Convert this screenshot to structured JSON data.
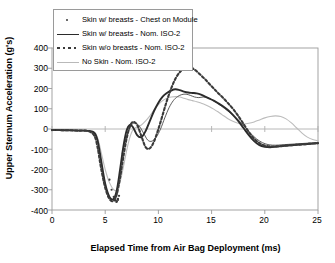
{
  "chart_data": {
    "type": "line",
    "title": "",
    "xlabel": "Elapsed Time from Air Bag Deployment (ms)",
    "ylabel": "Upper Sternum Acceleration (g's)",
    "xlim": [
      0,
      25
    ],
    "ylim": [
      -400,
      400
    ],
    "xticks": [
      0,
      5,
      10,
      15,
      20,
      25
    ],
    "yticks": [
      400,
      300,
      200,
      100,
      0,
      -100,
      -200,
      -300,
      -400
    ],
    "grid": false,
    "legend_position": "top-left",
    "series": [
      {
        "name": "Skin w/ breasts - Chest on Module",
        "style": "dot-marker",
        "color": "#3a3a3a",
        "x": [
          5.4,
          5.6,
          5.8,
          6.0,
          6.1,
          6.2,
          6.3,
          6.1,
          5.9,
          6.05,
          6.2
        ],
        "y": [
          -250,
          -300,
          -335,
          -352,
          -358,
          -345,
          -330,
          -315,
          -340,
          -360,
          -350
        ]
      },
      {
        "name": "Skin w/ breasts - Nom. ISO-2",
        "style": "solid",
        "color": "#2b2b2b",
        "x": [
          0,
          0.5,
          1,
          1.5,
          2,
          2.5,
          3,
          3.5,
          4,
          4.3,
          4.6,
          5,
          5.4,
          5.8,
          6.1,
          6.4,
          6.7,
          7,
          7.3,
          7.6,
          8,
          8.4,
          8.8,
          9.2,
          9.6,
          10,
          10.4,
          10.8,
          11.2,
          11.6,
          12,
          12.4,
          12.8,
          13.2,
          13.6,
          14,
          14.4,
          14.8,
          15.2,
          15.6,
          16,
          16.5,
          17,
          17.5,
          18,
          18.5,
          19,
          19.5,
          20,
          20.5,
          21,
          21.5,
          22,
          22.5,
          23,
          23.5,
          24,
          24.5,
          25
        ],
        "y": [
          -5,
          -5,
          -6,
          -6,
          -7,
          -8,
          -8,
          -10,
          -20,
          -60,
          -150,
          -270,
          -335,
          -345,
          -300,
          -200,
          -90,
          -10,
          20,
          10,
          -30,
          -40,
          -10,
          40,
          90,
          130,
          160,
          178,
          190,
          196,
          192,
          185,
          180,
          178,
          176,
          170,
          160,
          150,
          140,
          128,
          115,
          95,
          70,
          40,
          5,
          -30,
          -60,
          -80,
          -88,
          -90,
          -88,
          -85,
          -82,
          -80,
          -78,
          -76,
          -74,
          -72,
          -70
        ]
      },
      {
        "name": "Skin w/o breasts - Nom. ISO-2",
        "style": "dashed",
        "color": "#3a3a3a",
        "x": [
          0,
          0.5,
          1,
          1.5,
          2,
          2.5,
          3,
          3.5,
          4,
          4.3,
          4.6,
          5,
          5.4,
          5.8,
          6.1,
          6.4,
          6.7,
          7,
          7.3,
          7.6,
          8,
          8.4,
          8.8,
          9.2,
          9.6,
          10,
          10.4,
          10.8,
          11.2,
          11.6,
          12,
          12.4,
          12.8,
          13.2,
          13.6,
          14,
          14.4,
          14.8,
          15.2,
          15.6,
          16,
          16.5,
          17,
          17.5,
          18,
          18.5,
          19,
          19.5,
          20,
          20.5,
          21,
          21.5,
          22,
          22.5,
          23,
          23.5,
          24,
          24.5,
          25
        ],
        "y": [
          -5,
          -5,
          -6,
          -6,
          -7,
          -8,
          -8,
          -12,
          -35,
          -95,
          -190,
          -290,
          -345,
          -355,
          -320,
          -240,
          -140,
          -50,
          10,
          35,
          20,
          -35,
          -90,
          -95,
          -60,
          0,
          70,
          140,
          200,
          248,
          280,
          300,
          308,
          300,
          285,
          265,
          245,
          222,
          200,
          178,
          158,
          130,
          100,
          65,
          25,
          -15,
          -48,
          -70,
          -82,
          -86,
          -86,
          -84,
          -82,
          -80,
          -78,
          -76,
          -74,
          -72,
          -70
        ]
      },
      {
        "name": "No Skin - Nom. ISO-2",
        "style": "light-solid",
        "color": "#bcbcbc",
        "x": [
          0,
          0.5,
          1,
          1.5,
          2,
          2.5,
          3,
          3.5,
          4,
          4.3,
          4.6,
          5,
          5.4,
          5.8,
          6.1,
          6.4,
          6.7,
          7,
          7.3,
          7.6,
          8,
          8.4,
          8.8,
          9.2,
          9.6,
          10,
          10.4,
          10.8,
          11.2,
          11.6,
          12,
          12.4,
          12.8,
          13.2,
          13.6,
          14,
          14.4,
          14.8,
          15.2,
          15.6,
          16,
          16.5,
          17,
          17.5,
          18,
          18.5,
          19,
          19.5,
          20,
          20.5,
          21,
          21.5,
          22,
          22.5,
          23,
          23.5,
          24,
          24.5,
          25
        ],
        "y": [
          -3,
          -3,
          -4,
          -4,
          -5,
          -5,
          -6,
          -8,
          -15,
          -45,
          -110,
          -200,
          -265,
          -300,
          -300,
          -260,
          -190,
          -110,
          -45,
          -5,
          10,
          20,
          40,
          65,
          95,
          120,
          140,
          152,
          158,
          160,
          158,
          152,
          145,
          140,
          135,
          128,
          120,
          110,
          98,
          85,
          70,
          52,
          38,
          28,
          25,
          28,
          35,
          45,
          55,
          62,
          65,
          62,
          50,
          30,
          5,
          -20,
          -40,
          -52,
          -58
        ]
      },
      {
        "name": "Skin w/ breasts - Nom. ISO-2 (secondary dark trace)",
        "style": "solid-thin",
        "color": "#4a4a4a",
        "x": [
          6.6,
          7.0,
          7.4,
          7.8,
          8.2,
          8.6,
          9.0,
          9.4,
          9.8,
          10.2,
          10.6,
          11.0,
          11.4,
          11.8,
          12.2,
          12.6,
          13.0,
          13.4,
          13.8,
          14.2,
          14.6,
          15.0,
          15.4,
          15.8,
          16.2,
          16.8,
          17.4,
          18.0,
          18.6,
          19.2,
          19.8,
          20.4,
          21.0,
          21.6,
          22.2,
          22.8,
          23.4,
          24.0,
          24.6,
          25
        ],
        "y": [
          -120,
          -40,
          15,
          30,
          15,
          -20,
          -55,
          -60,
          -40,
          0,
          55,
          105,
          140,
          160,
          170,
          172,
          166,
          158,
          155,
          158,
          155,
          145,
          132,
          118,
          102,
          78,
          50,
          18,
          -18,
          -48,
          -68,
          -78,
          -80,
          -78,
          -76,
          -74,
          -72,
          -70,
          -68,
          -66
        ]
      }
    ]
  },
  "axes": {
    "y_tick_labels": [
      "400",
      "300",
      "200",
      "100",
      "0",
      "-100",
      "-200",
      "-300",
      "-400"
    ],
    "x_tick_labels": [
      "0",
      "5",
      "10",
      "15",
      "20",
      "25"
    ],
    "x_title": "Elapsed Time from Air Bag Deployment (ms)",
    "y_title": "Upper Sternum Acceleration (g's)"
  },
  "legend": {
    "items": [
      {
        "label": "Skin w/ breasts - Chest on Module",
        "key": "dot"
      },
      {
        "label": "Skin w/ breasts - Nom. ISO-2",
        "key": "solid"
      },
      {
        "label": "Skin w/o breasts - Nom. ISO-2",
        "key": "dash"
      },
      {
        "label": "No Skin - Nom. ISO-2",
        "key": "light"
      }
    ]
  },
  "colors": {
    "frame": "#9a9a9a",
    "zero_line": "#b0b0b0",
    "dark_series": "#2b2b2b",
    "mid_series": "#3a3a3a",
    "light_series": "#bcbcbc",
    "background": "#ffffff"
  }
}
